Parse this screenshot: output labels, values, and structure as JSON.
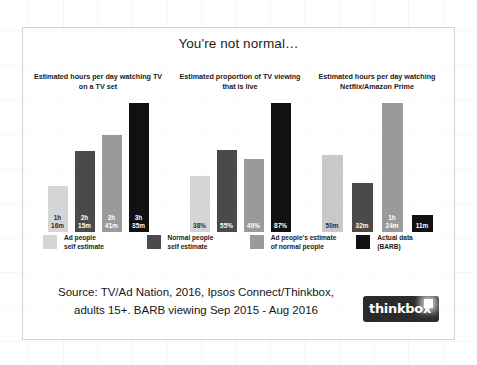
{
  "chart_data": {
    "type": "bar",
    "title": "You're not normal…",
    "grid": false,
    "legend_position": "bottom",
    "categories": [
      "Ad people self estimate",
      "Normal people self estimate",
      "Ad people's estimate of normal people",
      "Actual data (BARB)"
    ],
    "panels": [
      {
        "title": "Estimated hours per day\nwatching TV on a TV set",
        "unit": "hours:minutes",
        "ymax": 230,
        "bars": [
          {
            "series": "Ad people self estimate",
            "label": "1h\n16m",
            "value": 76,
            "color": "#d5d5d5",
            "label_color": "#2a2a2a"
          },
          {
            "series": "Normal people self estimate",
            "label": "2h\n15m",
            "value": 135,
            "color": "#4a4a4a",
            "label_color": "#ffffff"
          },
          {
            "series": "Ad people's estimate of normal people",
            "label": "2h\n41m",
            "value": 161,
            "color": "#9a9a9a",
            "label_color": "#ffffff"
          },
          {
            "series": "Actual data (BARB)",
            "label": "3h\n35m",
            "value": 215,
            "color": "#111111",
            "label_color": "#ffffff"
          }
        ]
      },
      {
        "title": "Estimated proportion of\nTV viewing that is live",
        "unit": "percent",
        "ymax": 93,
        "bars": [
          {
            "series": "Ad people self estimate",
            "label": "38%",
            "value": 38,
            "color": "#d5d5d5",
            "label_color": "#2a2a2a"
          },
          {
            "series": "Normal people self estimate",
            "label": "55%",
            "value": 55,
            "color": "#4a4a4a",
            "label_color": "#ffffff"
          },
          {
            "series": "Ad people's estimate of normal people",
            "label": "49%",
            "value": 49,
            "color": "#9a9a9a",
            "label_color": "#ffffff"
          },
          {
            "series": "Actual data (BARB)",
            "label": "87%",
            "value": 87,
            "color": "#111111",
            "label_color": "#ffffff"
          }
        ]
      },
      {
        "title": "Estimated hours per day watching\nNetflix/Amazon Prime",
        "unit": "minutes",
        "ymax": 90,
        "bars": [
          {
            "series": "Ad people self estimate",
            "label": "50m",
            "value": 50,
            "color": "#c8c8c8",
            "label_color": "#2a2a2a"
          },
          {
            "series": "Normal people self estimate",
            "label": "32m",
            "value": 32,
            "color": "#4a4a4a",
            "label_color": "#ffffff"
          },
          {
            "series": "Ad people's estimate of normal people",
            "label": "1h\n24m",
            "value": 84,
            "color": "#9a9a9a",
            "label_color": "#ffffff"
          },
          {
            "series": "Actual data (BARB)",
            "label": "11m",
            "value": 11,
            "color": "#111111",
            "label_color": "#ffffff"
          }
        ]
      }
    ],
    "legend": [
      {
        "label": "Ad people\nself estimate",
        "color": "#d5d5d5"
      },
      {
        "label": "Normal people\nself estimate",
        "color": "#4a4a4a"
      },
      {
        "label": "Ad people's estimate\nof normal people",
        "color": "#9a9a9a"
      },
      {
        "label": "Actual data\n(BARB)",
        "color": "#111111"
      }
    ]
  },
  "footer": {
    "source": "Source: TV/Ad Nation, 2016,  Ipsos Connect/Thinkbox,\nadults 15+. BARB viewing Sep 2015 - Aug 2016",
    "logo_text": "thinkbox"
  }
}
